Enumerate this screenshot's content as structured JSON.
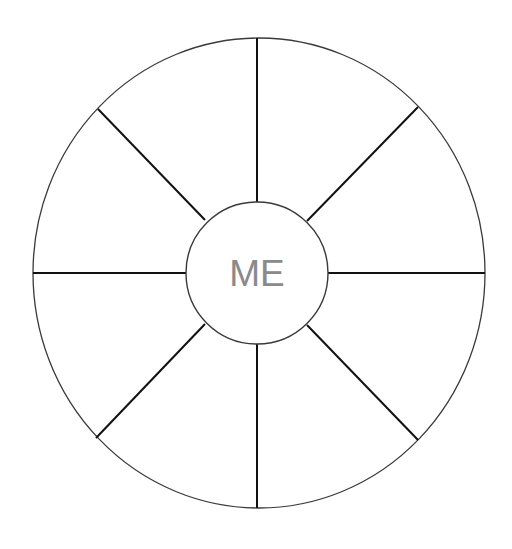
{
  "diagram": {
    "type": "segmented-circle",
    "center_label": "ME",
    "segments": 8,
    "colors": {
      "background": "#ffffff",
      "ring_stroke": "#3a3a3a",
      "spoke_stroke": "#111111",
      "label": "#8a8a8a"
    },
    "outer_circle": {
      "cx": 259,
      "cy": 273,
      "rx": 226,
      "ry": 235
    },
    "inner_circle": {
      "cx": 257,
      "cy": 273,
      "r": 71
    },
    "spokes": [
      {
        "name": "top",
        "x1": 257,
        "y1": 202,
        "x2": 257,
        "y2": 38
      },
      {
        "name": "top-right",
        "x1": 307,
        "y1": 221,
        "x2": 418,
        "y2": 107
      },
      {
        "name": "right",
        "x1": 328,
        "y1": 273,
        "x2": 485,
        "y2": 273
      },
      {
        "name": "bottom-right",
        "x1": 307,
        "y1": 325,
        "x2": 418,
        "y2": 440
      },
      {
        "name": "bottom",
        "x1": 257,
        "y1": 344,
        "x2": 257,
        "y2": 508
      },
      {
        "name": "bottom-left",
        "x1": 205,
        "y1": 324,
        "x2": 96,
        "y2": 438
      },
      {
        "name": "left",
        "x1": 186,
        "y1": 273,
        "x2": 33,
        "y2": 273
      },
      {
        "name": "top-left",
        "x1": 205,
        "y1": 220,
        "x2": 98,
        "y2": 109
      }
    ]
  }
}
